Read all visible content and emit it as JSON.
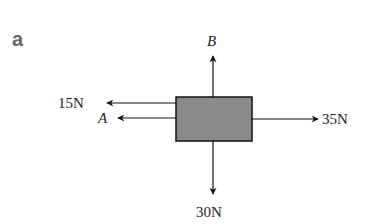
{
  "panel_label": "a",
  "forces": {
    "up": {
      "label": "B"
    },
    "left_top": {
      "label": "15N"
    },
    "left_bottom": {
      "label": "A"
    },
    "right": {
      "label": "35N"
    },
    "down": {
      "label": "30N"
    }
  },
  "colors": {
    "box_fill": "#8a8a8a",
    "stroke": "#111111"
  }
}
